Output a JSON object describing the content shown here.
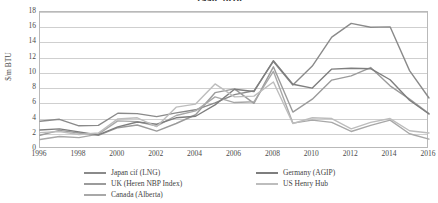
{
  "chart_data": {
    "type": "line",
    "title": "1996-2016",
    "xlabel": "",
    "ylabel": "$/m BTU",
    "x": [
      1996,
      1997,
      1998,
      1999,
      2000,
      2001,
      2002,
      2003,
      2004,
      2005,
      2006,
      2007,
      2008,
      2009,
      2010,
      2011,
      2012,
      2013,
      2014,
      2015,
      2016
    ],
    "xlim": [
      1996,
      2016
    ],
    "ylim": [
      0,
      18
    ],
    "yticks": [
      0,
      2,
      4,
      6,
      8,
      10,
      12,
      14,
      16,
      18
    ],
    "xticks": [
      1996,
      1998,
      2000,
      2002,
      2004,
      2006,
      2008,
      2010,
      2012,
      2014,
      2016
    ],
    "grid": true,
    "legend_position": "bottom",
    "series": [
      {
        "name": "Japan cif (LNG)",
        "color": "#8a8a8a",
        "values": [
          3.65,
          3.9,
          3.05,
          3.1,
          4.7,
          4.65,
          4.25,
          4.75,
          5.15,
          6.05,
          7.15,
          7.65,
          11.5,
          8.4,
          10.9,
          14.7,
          16.5,
          16.0,
          16.05,
          10.3,
          6.7
        ]
      },
      {
        "name": "UK (Heren NBP Index)",
        "color": "#9b9b9b",
        "values": [
          1.8,
          2.45,
          2.1,
          1.8,
          2.8,
          3.15,
          2.35,
          3.35,
          4.5,
          7.4,
          7.9,
          6.0,
          10.8,
          4.85,
          6.55,
          9.05,
          9.6,
          10.7,
          8.3,
          6.55,
          4.65
        ]
      },
      {
        "name": "Canada (Alberta)",
        "color": "#a8a8a8",
        "values": [
          1.25,
          1.65,
          1.5,
          1.95,
          3.7,
          3.6,
          3.0,
          4.4,
          5.0,
          6.85,
          6.1,
          6.2,
          10.2,
          3.4,
          3.8,
          3.5,
          2.3,
          3.1,
          3.8,
          2.0,
          1.3
        ]
      },
      {
        "name": "Germany (AGIP)",
        "color": "#7e7e7e",
        "values": [
          2.5,
          2.65,
          2.25,
          1.85,
          2.9,
          3.55,
          3.25,
          4.1,
          4.3,
          5.8,
          7.85,
          7.55,
          11.6,
          8.5,
          8.0,
          10.5,
          10.6,
          10.55,
          9.1,
          6.4,
          4.6
        ]
      },
      {
        "name": "US Henry Hub",
        "color": "#bdbdbd",
        "values": [
          2.15,
          2.3,
          1.9,
          2.1,
          3.95,
          4.1,
          2.95,
          5.5,
          5.9,
          8.55,
          6.85,
          6.95,
          8.8,
          3.35,
          4.1,
          4.0,
          2.65,
          3.5,
          4.0,
          2.4,
          2.1
        ]
      }
    ]
  }
}
